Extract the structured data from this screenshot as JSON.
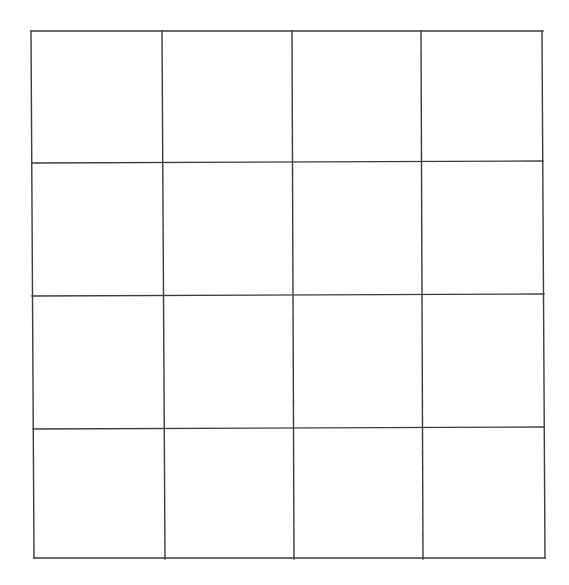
{
  "canvas": {
    "width": 569,
    "height": 585,
    "background": "#ffffff",
    "line_color": "#3c3c3c"
  },
  "grid": {
    "rows": 4,
    "cols": 4,
    "horizontal_lines": [
      {
        "x1": 31,
        "y1": 31,
        "x2": 543,
        "y2": 31
      },
      {
        "x1": 32,
        "y1": 163,
        "x2": 543,
        "y2": 161
      },
      {
        "x1": 32,
        "y1": 296,
        "x2": 544,
        "y2": 294
      },
      {
        "x1": 33,
        "y1": 429,
        "x2": 544,
        "y2": 427
      },
      {
        "x1": 34,
        "y1": 558,
        "x2": 545,
        "y2": 558
      }
    ],
    "vertical_lines": [
      {
        "x1": 31,
        "y1": 31,
        "x2": 34,
        "y2": 558
      },
      {
        "x1": 162,
        "y1": 31,
        "x2": 165,
        "y2": 559
      },
      {
        "x1": 292,
        "y1": 31,
        "x2": 294,
        "y2": 559
      },
      {
        "x1": 421,
        "y1": 31,
        "x2": 423,
        "y2": 559
      },
      {
        "x1": 542,
        "y1": 31,
        "x2": 545,
        "y2": 558
      }
    ],
    "cells": [
      [
        "",
        "",
        "",
        ""
      ],
      [
        "",
        "",
        "",
        ""
      ],
      [
        "",
        "",
        "",
        ""
      ],
      [
        "",
        "",
        "",
        ""
      ]
    ]
  }
}
